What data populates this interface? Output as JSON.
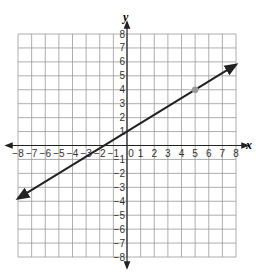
{
  "chart_data": {
    "type": "line",
    "title": "",
    "xlabel": "x",
    "ylabel": "y",
    "xlim": [
      -8,
      8
    ],
    "ylim": [
      -8,
      8
    ],
    "grid": true,
    "x_ticks": [
      -8,
      -7,
      -6,
      -5,
      -4,
      -3,
      -2,
      -1,
      0,
      1,
      2,
      3,
      4,
      5,
      6,
      7,
      8
    ],
    "y_ticks": [
      -8,
      -7,
      -6,
      -5,
      -4,
      -3,
      -2,
      -1,
      1,
      2,
      3,
      4,
      5,
      6,
      7,
      8
    ],
    "x_tick_labels": [
      "-8",
      "-7",
      "-6",
      "-5",
      "-4",
      "-3",
      "-2",
      "-1",
      "0",
      "1",
      "2",
      "3",
      "4",
      "5",
      "6",
      "7",
      "8"
    ],
    "y_tick_labels": [
      "-8",
      "-7",
      "-6",
      "-5",
      "-4",
      "-3",
      "-2",
      "-1",
      "1",
      "2",
      "3",
      "4",
      "5",
      "6",
      "7",
      "8"
    ],
    "series": [
      {
        "name": "line",
        "equation": "y = 0.6x + 1",
        "slope": 0.6,
        "intercept": 1,
        "x": [
          -8,
          8
        ],
        "y": [
          -3.8,
          5.8
        ],
        "arrows": "both",
        "color": "#222222"
      }
    ],
    "points": [
      {
        "x": 5,
        "y": 4,
        "color": "#999999"
      }
    ]
  },
  "labels": {
    "x_axis": "x",
    "y_axis": "y"
  }
}
